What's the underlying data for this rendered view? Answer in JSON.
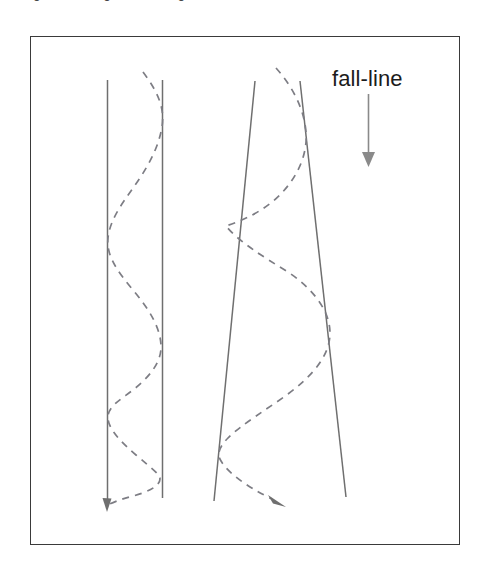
{
  "figure": {
    "caption_clipped": "Figure: carving vs. skidding turns",
    "frame": {
      "border_color": "#3a3a3a",
      "background": "#ffffff",
      "x": 30,
      "y": 36,
      "width": 430,
      "height": 509
    },
    "annotations": {
      "fall_line_label": "fall-line"
    },
    "colors": {
      "track_line": "#6f6f6f",
      "dashed_path": "#7d7d84",
      "arrow": "#6f6f6f",
      "fall_line_arrow": "#8a8a8a",
      "text": "#1c1c1c",
      "frame": "#3a3a3a"
    },
    "elements": [
      {
        "name": "left-track",
        "type": "parallel-corridor",
        "description": "two vertical parallel boundary lines",
        "left_line": {
          "x1": 107,
          "y1": 80,
          "x2": 107,
          "y2": 503
        },
        "right_line": {
          "x1": 162,
          "y1": 80,
          "x2": 162,
          "y2": 498
        }
      },
      {
        "name": "left-dashed-path",
        "type": "oscillating-dashed-curve",
        "description": "short-radius turns staying inside a narrow corridor",
        "start": {
          "x": 143,
          "y": 72
        },
        "end": {
          "x": 107,
          "y": 506
        },
        "turn_count": 5,
        "dash_pattern": "7 6"
      },
      {
        "name": "right-track",
        "type": "diverging-corridor",
        "description": "two lines fanning outward down the slope",
        "left_line": {
          "x1": 255,
          "y1": 81,
          "x2": 214,
          "y2": 501
        },
        "right_line": {
          "x1": 300,
          "y1": 81,
          "x2": 346,
          "y2": 497
        }
      },
      {
        "name": "right-dashed-path",
        "type": "oscillating-dashed-curve",
        "description": "long-radius turns widening across the corridor",
        "start": {
          "x": 276,
          "y": 68
        },
        "end": {
          "x": 282,
          "y": 505
        },
        "turn_count": 4,
        "dash_pattern": "7 6"
      },
      {
        "name": "fall-line-arrow",
        "type": "straight-arrow",
        "direction": "down",
        "x": 368,
        "y1": 94,
        "y2": 166
      }
    ]
  }
}
